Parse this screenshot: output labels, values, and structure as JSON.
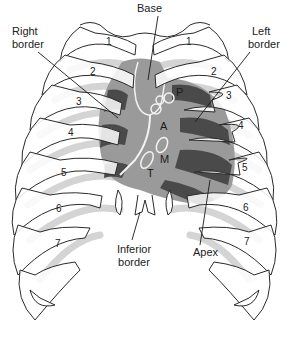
{
  "figure": {
    "labels": {
      "base": "Base",
      "right_border_line1": "Right",
      "right_border_line2": "border",
      "left_border_line1": "Left",
      "left_border_line2": "border",
      "inferior_border_line1": "Inferior",
      "inferior_border_line2": "border",
      "apex": "Apex"
    },
    "valves": {
      "pulmonary": "P",
      "aortic": "A",
      "mitral": "M",
      "tricuspid": "T"
    },
    "ribs_right": [
      "1",
      "2",
      "3",
      "4",
      "5",
      "6",
      "7"
    ],
    "ribs_left": [
      "1",
      "2",
      "3",
      "4",
      "5",
      "6",
      "7"
    ],
    "colors": {
      "rib_outline": "#2a2a2a",
      "rib_fill": "#ffffff",
      "posterior_rib_shadow": "#d4d4d4",
      "heart_fill": "#9a9a9a",
      "heart_dark": "#4a4a4a",
      "valve_outline": "#f2f2f2"
    }
  }
}
